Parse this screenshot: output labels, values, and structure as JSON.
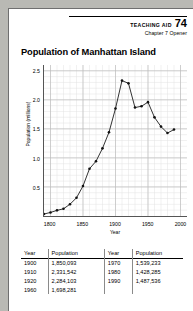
{
  "header": {
    "aid_label": "Teaching Aid",
    "aid_number": "74",
    "chapter": "Chapter 7 Opener"
  },
  "title": "Population of Manhattan Island",
  "chart_data": {
    "type": "line",
    "title": "Population of Manhattan Island",
    "xlabel": "Year",
    "ylabel": "Population (millions)",
    "xlim": [
      1790,
      2010
    ],
    "ylim": [
      0,
      2.6
    ],
    "xticks": [
      "1800",
      "1850",
      "1900",
      "1950",
      "2000"
    ],
    "xtick_values": [
      1800,
      1850,
      1900,
      1950,
      2000
    ],
    "yticks": [
      "0.5",
      "1.0",
      "1.5",
      "2.0",
      "2.5"
    ],
    "ytick_values": [
      0.5,
      1.0,
      1.5,
      2.0,
      2.5
    ],
    "grid": true,
    "legend": "none",
    "markers": true,
    "x": [
      1790,
      1800,
      1810,
      1820,
      1830,
      1840,
      1850,
      1860,
      1870,
      1880,
      1890,
      1900,
      1910,
      1920,
      1930,
      1940,
      1950,
      1960,
      1970,
      1980,
      1990
    ],
    "values": [
      0.033,
      0.06,
      0.096,
      0.123,
      0.202,
      0.312,
      0.515,
      0.813,
      0.942,
      1.164,
      1.441,
      1.85,
      2.331,
      2.284,
      1.867,
      1.89,
      1.96,
      1.698,
      1.539,
      1.428,
      1.488
    ]
  },
  "table": {
    "columns": [
      "Year",
      "Population",
      "Year",
      "Population"
    ],
    "left_rows": [
      {
        "year": "1900",
        "population": "1,850,093"
      },
      {
        "year": "1910",
        "population": "2,331,542"
      },
      {
        "year": "1920",
        "population": "2,284,103"
      },
      {
        "year": "1960",
        "population": "1,698,281"
      }
    ],
    "right_rows": [
      {
        "year": "1970",
        "population": "1,539,233"
      },
      {
        "year": "1980",
        "population": "1,428,285"
      },
      {
        "year": "1990",
        "population": "1,487,536"
      }
    ]
  }
}
